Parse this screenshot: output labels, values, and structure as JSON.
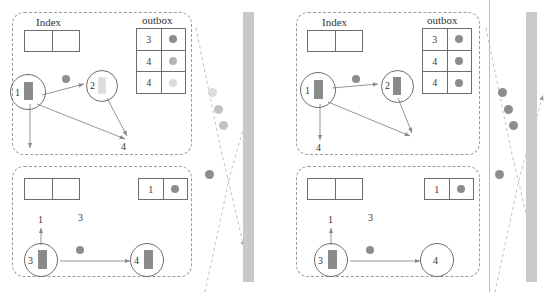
{
  "diagram": {
    "colors": {
      "panel_border": "#9a9a9a",
      "table_border": "#6d6d6d",
      "node_border": "#6d6d6d",
      "arrow": "#8a8a8a",
      "dot_dark": "#8d8d8d",
      "dot_mid": "#b4b4b4",
      "dot_light": "#d8d8d8",
      "bar_dark": "#8a8a8a",
      "bar_light": "#dcdcdc",
      "wall": "#c9c9c9",
      "text": "#333333"
    },
    "labels": {
      "index": "Index",
      "outbox": "outbox"
    },
    "panels": [
      {
        "id": "left-top",
        "index_table": {
          "title": "Index",
          "rows": [
            [
              "",
              ""
            ]
          ]
        },
        "outbox_table": {
          "title": "outbox",
          "rows": [
            {
              "value": "3",
              "dot": "dark"
            },
            {
              "value": "4",
              "dot": "mid"
            },
            {
              "value": "4",
              "dot": "light"
            }
          ]
        },
        "nodes": [
          {
            "label": "1",
            "bar": "dark"
          },
          {
            "label": "2",
            "bar": "light"
          }
        ],
        "free_labels": [
          "4"
        ],
        "floating_dots": [
          "dark"
        ]
      },
      {
        "id": "left-bottom",
        "index_table": {
          "rows": [
            [
              "",
              ""
            ]
          ]
        },
        "outbox_table": {
          "rows": [
            {
              "value": "1",
              "dot": "dark"
            }
          ]
        },
        "nodes": [
          {
            "label": "3",
            "bar": "dark"
          },
          {
            "label": "4",
            "bar": "dark"
          }
        ],
        "free_labels": [
          "1",
          "3"
        ],
        "floating_dots": [
          "dark"
        ]
      },
      {
        "id": "right-top",
        "index_table": {
          "title": "Index",
          "rows": [
            [
              "",
              ""
            ]
          ]
        },
        "outbox_table": {
          "title": "outbox",
          "rows": [
            {
              "value": "3",
              "dot": "dark"
            },
            {
              "value": "4",
              "dot": "dark"
            },
            {
              "value": "4",
              "dot": "dark"
            }
          ]
        },
        "nodes": [
          {
            "label": "1",
            "bar": "dark"
          },
          {
            "label": "2",
            "bar": "dark"
          }
        ],
        "free_labels": [
          "4"
        ],
        "floating_dots": [
          "dark"
        ]
      },
      {
        "id": "right-bottom",
        "index_table": {
          "rows": [
            [
              "",
              ""
            ]
          ]
        },
        "outbox_table": {
          "rows": [
            {
              "value": "1",
              "dot": "dark"
            }
          ]
        },
        "nodes": [
          {
            "label": "3",
            "bar": "dark"
          },
          {
            "label": "4",
            "bar": "none"
          }
        ],
        "free_labels": [
          "1",
          "3"
        ],
        "floating_dots": [
          "dark"
        ]
      }
    ],
    "channels": [
      {
        "id": "left-channel",
        "wall": true,
        "in_flight_dots": [
          "light",
          "mid",
          "mid",
          "dark"
        ]
      },
      {
        "id": "right-channel",
        "wall": true,
        "divider_line": true,
        "in_flight_dots": [
          "dark",
          "dark",
          "dark",
          "dark"
        ]
      }
    ]
  }
}
